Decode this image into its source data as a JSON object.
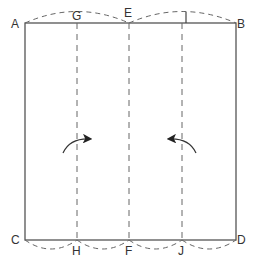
{
  "diagram": {
    "type": "paper-folding",
    "corner_labels": {
      "top_left": "A",
      "top_right": "B",
      "bottom_left": "C",
      "bottom_right": "D"
    },
    "top_labels": [
      "G",
      "E",
      "I"
    ],
    "bottom_labels": [
      "H",
      "F",
      "J"
    ],
    "fold_lines": [
      "GH",
      "EF",
      "IJ"
    ],
    "arrows": [
      {
        "name": "left-fold-arrow",
        "direction": "right"
      },
      {
        "name": "right-fold-arrow",
        "direction": "left"
      }
    ],
    "colors": {
      "line": "#555555",
      "dash": "#666666",
      "label": "#333333"
    }
  }
}
